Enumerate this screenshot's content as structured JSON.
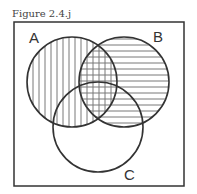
{
  "figure": {
    "caption": "Figure 2.4.j",
    "universe": {
      "label": ""
    },
    "sets": [
      {
        "name": "A",
        "label": "A",
        "shading": "vertical-lines"
      },
      {
        "name": "B",
        "label": "B",
        "shading": "horizontal-lines"
      },
      {
        "name": "C",
        "label": "C",
        "shading": "none"
      }
    ],
    "shaded_regions": [
      "A",
      "B",
      "A∩B (cross-hatched)"
    ],
    "colors": {
      "stroke": "#333333",
      "hatch": "#777777",
      "background": "#ffffff"
    }
  }
}
